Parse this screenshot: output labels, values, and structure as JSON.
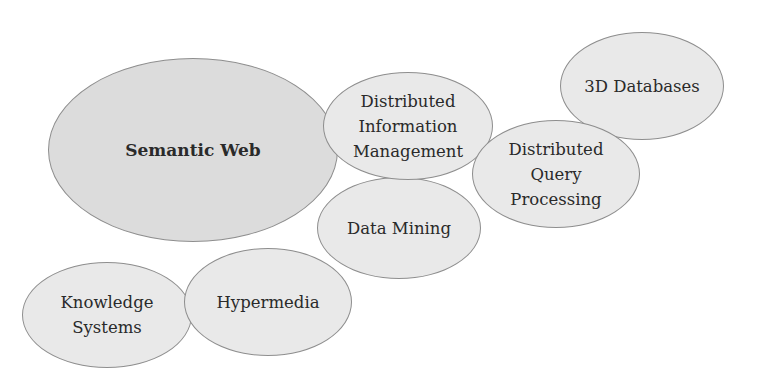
{
  "diagram": {
    "type": "overlapping-ellipse-cluster",
    "colors": {
      "background": "#ffffff",
      "node_fill": "#e9e9e9",
      "primary_fill": "#dcdcdc",
      "node_stroke": "#8e8e8e",
      "text": "#2a2a2a"
    },
    "nodes": [
      {
        "id": "semantic-web",
        "label": "Semantic Web",
        "primary": true,
        "cx": 193,
        "cy": 150,
        "rx": 145,
        "ry": 92
      },
      {
        "id": "distributed-information-management",
        "label": "Distributed\nInformation\nManagement",
        "primary": false,
        "cx": 408,
        "cy": 126,
        "rx": 85,
        "ry": 54
      },
      {
        "id": "3d-databases",
        "label": "3D Databases",
        "primary": false,
        "cx": 642,
        "cy": 86,
        "rx": 82,
        "ry": 54
      },
      {
        "id": "distributed-query-processing",
        "label": "Distributed\nQuery\nProcessing",
        "primary": false,
        "cx": 556,
        "cy": 174,
        "rx": 84,
        "ry": 54
      },
      {
        "id": "data-mining",
        "label": "Data Mining",
        "primary": false,
        "cx": 399,
        "cy": 228,
        "rx": 82,
        "ry": 51
      },
      {
        "id": "knowledge-systems",
        "label": "Knowledge\nSystems",
        "primary": false,
        "cx": 107,
        "cy": 315,
        "rx": 85,
        "ry": 53
      },
      {
        "id": "hypermedia",
        "label": "Hypermedia",
        "primary": false,
        "cx": 268,
        "cy": 302,
        "rx": 84,
        "ry": 54
      }
    ]
  }
}
